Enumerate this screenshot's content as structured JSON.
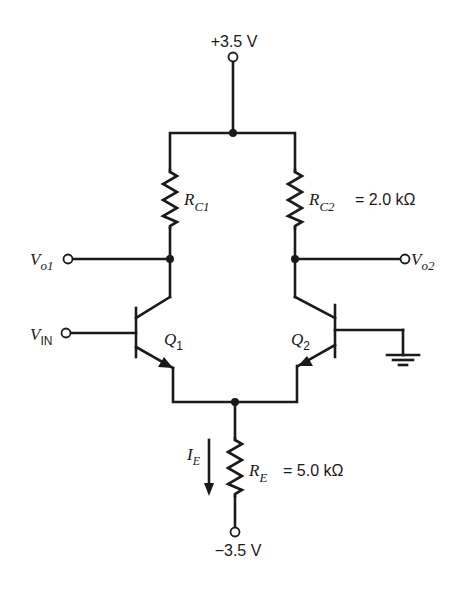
{
  "diagram": {
    "type": "circuit-schematic",
    "supplies": {
      "positive": "+3.5 V",
      "negative": "−3.5 V"
    },
    "resistors": {
      "rc1": {
        "symbol": "R",
        "sub": "C1",
        "value": ""
      },
      "rc2": {
        "symbol": "R",
        "sub": "C2",
        "value": "= 2.0 kΩ"
      },
      "re": {
        "symbol": "R",
        "sub": "E",
        "value": "= 5.0 kΩ"
      }
    },
    "transistors": {
      "q1": {
        "symbol": "Q",
        "sub": "1"
      },
      "q2": {
        "symbol": "Q",
        "sub": "2"
      }
    },
    "nodes": {
      "vo1": {
        "symbol": "V",
        "sub": "o1"
      },
      "vo2": {
        "symbol": "V",
        "sub": "o2"
      },
      "vin": {
        "symbol": "V",
        "sub": "IN"
      }
    },
    "current": {
      "symbol": "I",
      "sub": "E"
    },
    "colors": {
      "ink": "#1a1a1a",
      "background": "#ffffff"
    }
  }
}
